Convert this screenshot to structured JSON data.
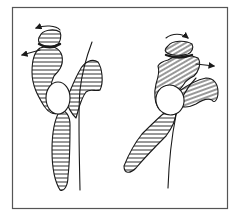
{
  "diagram": {
    "type": "anatomical-line-drawing",
    "frame": {
      "stroke": "#555555",
      "fill": "#ffffff"
    },
    "colors": {
      "line": "#1a1a1a",
      "hatch": "#1a1a1a",
      "background": "#ffffff"
    },
    "figures": [
      {
        "id": "left",
        "arrows": [
          {
            "kind": "curved-rotation",
            "direction": "left"
          },
          {
            "kind": "straight",
            "direction": "left"
          }
        ],
        "parts": [
          "top-disc",
          "upper-hatched-body",
          "oval",
          "right-hatched-wing",
          "lower-hatched-shaft",
          "thin-line"
        ]
      },
      {
        "id": "right",
        "arrows": [
          {
            "kind": "curved-rotation",
            "direction": "right"
          },
          {
            "kind": "straight",
            "direction": "right"
          }
        ],
        "parts": [
          "top-disc",
          "upper-hatched-body",
          "oval",
          "right-hatched-wing",
          "lower-hatched-shaft",
          "thin-line"
        ]
      }
    ]
  }
}
